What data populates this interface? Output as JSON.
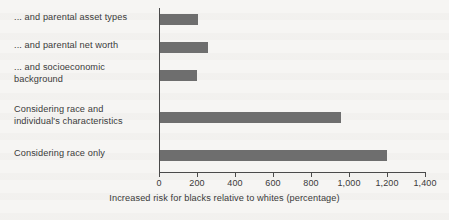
{
  "chart_data": {
    "type": "bar",
    "orientation": "horizontal",
    "title": "",
    "subtitle": "",
    "xlabel": "Increased risk for blacks relative to whites (percentage)",
    "ylabel": "",
    "categories": [
      "... and parental asset types",
      "... and parental net worth",
      "... and socioeconomic background",
      "Considering race and individual's characteristics",
      "Considering race only"
    ],
    "values": [
      200,
      250,
      195,
      950,
      1195
    ],
    "xlim": [
      0,
      1400
    ],
    "xticks": [
      0,
      200,
      400,
      600,
      800,
      1000,
      1200,
      1400
    ],
    "xtick_labels": [
      "0",
      "200",
      "400",
      "600",
      "800",
      "1,000",
      "1,200",
      "1,400"
    ],
    "grid": false,
    "legend": false,
    "bar_color": "#6e6e6e",
    "axis_color": "#4a4a4a",
    "text_color": "#3a3a3a",
    "background_color": "#f6f5f3"
  },
  "category_lines": [
    [
      "... and parental asset types"
    ],
    [
      "... and parental net worth"
    ],
    [
      "... and socioeconomic",
      "background"
    ],
    [
      "Considering race and",
      "individual's characteristics"
    ],
    [
      "Considering race only"
    ]
  ]
}
